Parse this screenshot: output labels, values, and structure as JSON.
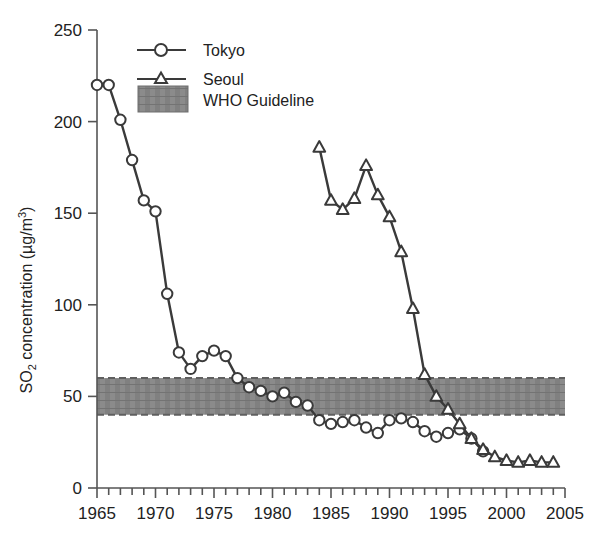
{
  "chart_data": {
    "type": "line",
    "title": "",
    "xlabel": "",
    "ylabel": "SO2 concentration (µg/m3)",
    "ylabel_parts": {
      "pre": "SO",
      "sub": "2",
      "mid": " concentration (µg/m",
      "sup": "3",
      "post": ")"
    },
    "xlim": [
      1965,
      2005
    ],
    "ylim": [
      0,
      250
    ],
    "grid": false,
    "legend_position": "top-left-inside",
    "x_ticks_major": [
      1965,
      1970,
      1975,
      1980,
      1985,
      1990,
      1995,
      2000,
      2005
    ],
    "x_tick_labels": [
      "1965",
      "1970",
      "1975",
      "1980",
      "1985",
      "1990",
      "1995",
      "2000",
      "2005"
    ],
    "x_minor_tick_step": 1,
    "y_ticks": [
      0,
      50,
      100,
      150,
      200,
      250
    ],
    "y_tick_labels": [
      "0",
      "50",
      "100",
      "150",
      "200",
      "250"
    ],
    "series": [
      {
        "name": "Tokyo",
        "marker": "circle",
        "color": "#3a3a3a",
        "x": [
          1965,
          1966,
          1967,
          1968,
          1969,
          1970,
          1971,
          1972,
          1973,
          1974,
          1975,
          1976,
          1977,
          1978,
          1979,
          1980,
          1981,
          1982,
          1983,
          1984,
          1985,
          1986,
          1987,
          1988,
          1989,
          1990,
          1991,
          1992,
          1993,
          1994,
          1995,
          1996,
          1997,
          1998
        ],
        "values": [
          220,
          220,
          201,
          179,
          157,
          151,
          106,
          74,
          65,
          72,
          75,
          72,
          60,
          55,
          53,
          50,
          52,
          47,
          45,
          37,
          35,
          36,
          37,
          33,
          30,
          37,
          38,
          36,
          31,
          28,
          30,
          32,
          27,
          20
        ]
      },
      {
        "name": "Seoul",
        "marker": "triangle",
        "color": "#3a3a3a",
        "x": [
          1984,
          1985,
          1986,
          1987,
          1988,
          1989,
          1990,
          1991,
          1992,
          1993,
          1994,
          1995,
          1996,
          1997,
          1998,
          1999,
          2000,
          2001,
          2002,
          2003,
          2004
        ],
        "values": [
          186,
          157,
          152,
          158,
          176,
          160,
          148,
          129,
          98,
          62,
          50,
          43,
          35,
          27,
          21,
          17,
          15,
          14,
          15,
          14,
          14
        ]
      }
    ],
    "band": {
      "name": "WHO Guideline",
      "y_lower": 40,
      "y_upper": 60,
      "color": "#808080",
      "style": "hatched"
    }
  },
  "legend": {
    "items": [
      {
        "label": "Tokyo",
        "marker": "circle"
      },
      {
        "label": "Seoul",
        "marker": "triangle"
      },
      {
        "label": "WHO Guideline",
        "marker": "band"
      }
    ]
  },
  "colors": {
    "line": "#3a3a3a",
    "axis": "#555555",
    "band": "#808080",
    "text": "#222222",
    "background": "#ffffff"
  }
}
